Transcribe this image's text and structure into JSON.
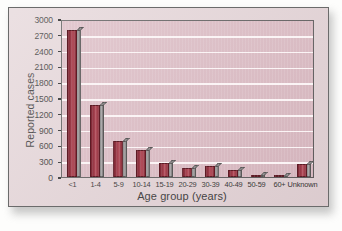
{
  "chart_data": {
    "type": "bar",
    "title": "",
    "subtitle": "",
    "xlabel": "Age group (years)",
    "ylabel": "Reported cases",
    "categories": [
      "<1",
      "1-4",
      "5-9",
      "10-14",
      "15-19",
      "20-29",
      "30-39",
      "40-49",
      "50-59",
      "60+",
      "Unknown"
    ],
    "values": [
      2790,
      1360,
      690,
      510,
      260,
      175,
      215,
      140,
      30,
      25,
      240
    ],
    "series": [
      {
        "name": "Reported cases",
        "values": [
          2790,
          1360,
          690,
          510,
          260,
          175,
          215,
          140,
          30,
          25,
          240
        ]
      }
    ],
    "ylim": [
      0,
      3000
    ],
    "ytick_labels": [
      "0",
      "300",
      "600",
      "900",
      "1200",
      "1500",
      "1800",
      "2100",
      "2400",
      "2700",
      "3000"
    ],
    "ytick_values": [
      0,
      300,
      600,
      900,
      1200,
      1500,
      1800,
      2100,
      2400,
      2700,
      3000
    ],
    "grid": true,
    "grid_axis": "y",
    "legend": false,
    "legend_position": "none",
    "annotations": [],
    "colors": {
      "bar_fill": "#a03e4c",
      "bar_edge": "#5d1b25",
      "bar_shadow": "#908d8e",
      "plot_background": "#d9b6bf",
      "gridline": "#fbf4f5",
      "figure_background": "#e3d3d6",
      "axis": "#4a4a4a",
      "text": "#1c1c1c"
    }
  }
}
